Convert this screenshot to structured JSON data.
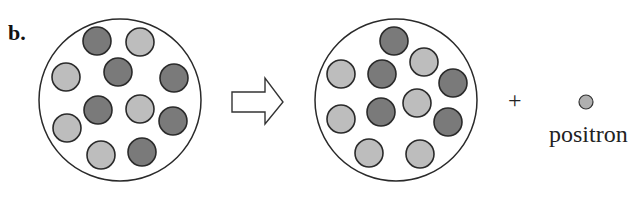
{
  "figure": {
    "panel_label": "b.",
    "plus_sign": "+",
    "positron_label": "positron"
  },
  "colors": {
    "background": "#ffffff",
    "outline": "#2a2a2a",
    "dark_particle": "#7a7a7a",
    "light_particle": "#bdbdbd",
    "positron": "#b0b0b0"
  },
  "nucleus_before": {
    "center": [
      120,
      100
    ],
    "radius": 81,
    "particle_radius": 14,
    "particles": [
      {
        "x": 97,
        "y": 41,
        "type": "dark"
      },
      {
        "x": 140,
        "y": 42,
        "type": "light"
      },
      {
        "x": 66,
        "y": 77,
        "type": "light"
      },
      {
        "x": 118,
        "y": 72,
        "type": "dark"
      },
      {
        "x": 174,
        "y": 78,
        "type": "dark"
      },
      {
        "x": 98,
        "y": 110,
        "type": "dark"
      },
      {
        "x": 140,
        "y": 109,
        "type": "light"
      },
      {
        "x": 173,
        "y": 121,
        "type": "dark"
      },
      {
        "x": 67,
        "y": 128,
        "type": "light"
      },
      {
        "x": 101,
        "y": 155,
        "type": "light"
      },
      {
        "x": 142,
        "y": 152,
        "type": "dark"
      }
    ]
  },
  "nucleus_after": {
    "center": [
      396,
      100
    ],
    "radius": 81,
    "particle_radius": 14,
    "particles": [
      {
        "x": 394,
        "y": 41,
        "type": "dark"
      },
      {
        "x": 424,
        "y": 62,
        "type": "light"
      },
      {
        "x": 341,
        "y": 74,
        "type": "light"
      },
      {
        "x": 382,
        "y": 74,
        "type": "dark"
      },
      {
        "x": 453,
        "y": 83,
        "type": "dark"
      },
      {
        "x": 417,
        "y": 103,
        "type": "light"
      },
      {
        "x": 381,
        "y": 112,
        "type": "dark"
      },
      {
        "x": 341,
        "y": 119,
        "type": "light"
      },
      {
        "x": 448,
        "y": 122,
        "type": "dark"
      },
      {
        "x": 369,
        "y": 153,
        "type": "light"
      },
      {
        "x": 420,
        "y": 154,
        "type": "light"
      }
    ]
  },
  "arrow": {
    "points": [
      [
        232,
        92
      ],
      [
        265,
        92
      ],
      [
        265,
        78
      ],
      [
        283,
        102
      ],
      [
        265,
        124
      ],
      [
        265,
        112
      ],
      [
        232,
        112
      ]
    ]
  },
  "positron": {
    "x": 586,
    "y": 102,
    "r": 7
  }
}
